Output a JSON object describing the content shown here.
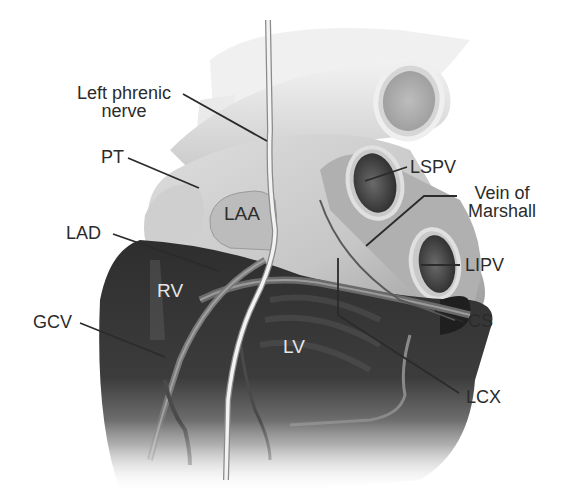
{
  "figure": {
    "colors": {
      "background": "#ffffff",
      "atrium_tissue": "#c9c9c9",
      "ventricle_tissue": "#3a3a3a",
      "vessel_light": "#e8e8e8",
      "vein_lumen": "#4a4a4a",
      "leader_line": "#2b2b2b",
      "label_text": "#2b2b2b",
      "inner_label_light": "#e6e6e6"
    }
  },
  "labels": {
    "left_phrenic_nerve_line1": "Left phrenic",
    "left_phrenic_nerve_line2": "nerve",
    "pt": "PT",
    "laa": "LAA",
    "lad": "LAD",
    "rv": "RV",
    "gcv": "GCV",
    "lv": "LV",
    "lspv": "LSPV",
    "vein_of_marshall_line1": "Vein of",
    "vein_of_marshall_line2": "Marshall",
    "lipv": "LIPV",
    "cs": "CS",
    "lcx": "LCX"
  }
}
